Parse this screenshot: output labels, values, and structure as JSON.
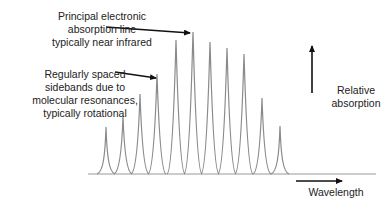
{
  "annotations": {
    "principal": [
      "Principal electronic",
      "absorption line",
      "typically near infrared"
    ],
    "sidebands": [
      "Regularly spaced",
      "sidebands due to",
      "molecular resonances,",
      "typically rotational"
    ],
    "relative_absorption": [
      "Relative",
      "absorption"
    ],
    "wavelength": "Wavelength"
  },
  "colors": {
    "peak_line": "#8a8a8a",
    "baseline": "#9a9a9a",
    "arrow": "#111111",
    "text": "#222222"
  },
  "spectrum": {
    "baseline_y": 174,
    "peaks": [
      {
        "x": 106,
        "top": 127
      },
      {
        "x": 123,
        "top": 116
      },
      {
        "x": 140,
        "top": 94
      },
      {
        "x": 157,
        "top": 74
      },
      {
        "x": 176,
        "top": 40
      },
      {
        "x": 193,
        "top": 32
      },
      {
        "x": 210,
        "top": 42
      },
      {
        "x": 227,
        "top": 48
      },
      {
        "x": 244,
        "top": 54
      },
      {
        "x": 262,
        "top": 98
      },
      {
        "x": 280,
        "top": 126
      }
    ]
  }
}
